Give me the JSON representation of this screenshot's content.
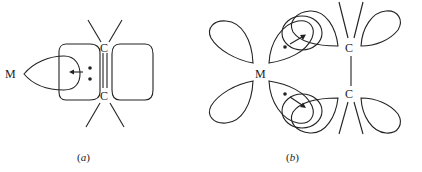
{
  "diagram": {
    "type": "molecular-orbital-bonding",
    "panels": [
      {
        "caption": "(a)",
        "caption_parts": {
          "open": "(",
          "letter": "a",
          "close": ")"
        },
        "metal_label": "M",
        "carbon_top_label": "C",
        "carbon_bottom_label": "C",
        "description": "sigma donation from alkene pi orbital to metal"
      },
      {
        "caption": "(b)",
        "caption_parts": {
          "open": "(",
          "letter": "b",
          "close": ")"
        },
        "metal_label": "M",
        "carbon_top_label": "C",
        "carbon_bottom_label": "C",
        "description": "pi back-donation from metal d orbital to alkene pi* orbital"
      }
    ],
    "colors": {
      "line": "#222222",
      "background": "#ffffff"
    }
  }
}
